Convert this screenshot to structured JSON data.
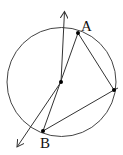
{
  "diagram": {
    "type": "circle-inscribed-triangle",
    "labels": {
      "A": "A",
      "B": "B"
    },
    "colors": {
      "stroke": "#333333",
      "points": "#000000",
      "background": "#ffffff"
    },
    "elements": [
      "circle",
      "diameter-line AB extended with arrows at both ends",
      "center point",
      "segment A to C",
      "segment C to B",
      "point C on circle (unlabeled)"
    ]
  }
}
